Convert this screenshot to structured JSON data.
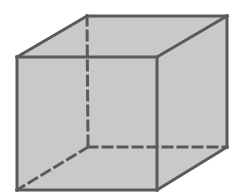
{
  "diagram": {
    "type": "wireframe-cube",
    "colors": {
      "background": "#ffffff",
      "fill": "#c9c9c9",
      "edge": "#5a5a5a"
    },
    "vertices": {
      "front_top_left": [
        17,
        57
      ],
      "front_top_right": [
        157,
        57
      ],
      "front_bottom_left": [
        17,
        190
      ],
      "front_bottom_right": [
        157,
        190
      ],
      "back_top_left": [
        87,
        16
      ],
      "back_top_right": [
        227,
        16
      ],
      "back_bottom_left": [
        88,
        147
      ],
      "back_bottom_right": [
        227,
        147
      ]
    },
    "visible_edges": [
      [
        "front_top_left",
        "front_top_right"
      ],
      [
        "front_top_right",
        "front_bottom_right"
      ],
      [
        "front_bottom_right",
        "front_bottom_left"
      ],
      [
        "front_bottom_left",
        "front_top_left"
      ],
      [
        "front_top_left",
        "back_top_left"
      ],
      [
        "back_top_left",
        "back_top_right"
      ],
      [
        "back_top_right",
        "front_top_right"
      ],
      [
        "back_top_right",
        "back_bottom_right"
      ],
      [
        "back_bottom_right",
        "front_bottom_right"
      ]
    ],
    "hidden_edges": [
      [
        "back_top_left",
        "back_bottom_left"
      ],
      [
        "back_bottom_left",
        "back_bottom_right"
      ],
      [
        "back_bottom_left",
        "front_bottom_left"
      ]
    ]
  }
}
